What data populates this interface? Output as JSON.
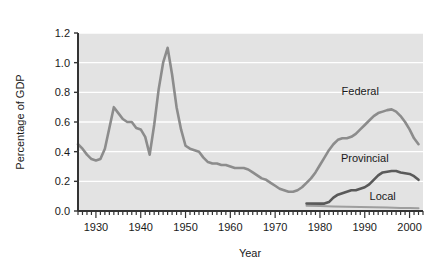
{
  "chart_data": {
    "type": "line",
    "title": "",
    "xlabel": "Year",
    "ylabel": "Percentage of GDP",
    "xlim": [
      1926,
      2003
    ],
    "ylim": [
      0.0,
      1.2
    ],
    "xticks": [
      1930,
      1940,
      1950,
      1960,
      1970,
      1980,
      1990,
      2000
    ],
    "xtick_labels": [
      "1930",
      "1940",
      "1950",
      "1960",
      "1970",
      "1980",
      "1990",
      "2000"
    ],
    "yticks": [
      0.0,
      0.2,
      0.4,
      0.6,
      0.8,
      1.0,
      1.2
    ],
    "ytick_labels": [
      "0.0",
      "0.2",
      "0.4",
      "0.6",
      "0.8",
      "1.0",
      "1.2"
    ],
    "minor_xtick_interval": 1,
    "grid": "horizontal-white-on-gray",
    "plot_background": "#e3e3e3",
    "legend": "inline-annotations",
    "series": [
      {
        "name": "Federal",
        "color": "#8c8c8c",
        "width": 2.6,
        "label_x": 1989,
        "label_y": 0.78,
        "x": [
          1926,
          1927,
          1928,
          1929,
          1930,
          1931,
          1932,
          1933,
          1934,
          1935,
          1936,
          1937,
          1938,
          1939,
          1940,
          1941,
          1942,
          1943,
          1944,
          1945,
          1946,
          1947,
          1948,
          1949,
          1950,
          1951,
          1952,
          1953,
          1954,
          1955,
          1956,
          1957,
          1958,
          1959,
          1960,
          1961,
          1962,
          1963,
          1964,
          1965,
          1966,
          1967,
          1968,
          1969,
          1970,
          1971,
          1972,
          1973,
          1974,
          1975,
          1976,
          1977,
          1978,
          1979,
          1980,
          1981,
          1982,
          1983,
          1984,
          1985,
          1986,
          1987,
          1988,
          1989,
          1990,
          1991,
          1992,
          1993,
          1994,
          1995,
          1996,
          1997,
          1998,
          1999,
          2000,
          2001,
          2002
        ],
        "y": [
          0.45,
          0.42,
          0.38,
          0.35,
          0.34,
          0.35,
          0.42,
          0.56,
          0.7,
          0.66,
          0.62,
          0.6,
          0.6,
          0.56,
          0.55,
          0.5,
          0.38,
          0.58,
          0.82,
          1.0,
          1.1,
          0.92,
          0.7,
          0.55,
          0.44,
          0.42,
          0.41,
          0.4,
          0.36,
          0.33,
          0.32,
          0.32,
          0.31,
          0.31,
          0.3,
          0.29,
          0.29,
          0.29,
          0.28,
          0.26,
          0.24,
          0.22,
          0.21,
          0.19,
          0.17,
          0.15,
          0.14,
          0.13,
          0.13,
          0.14,
          0.16,
          0.19,
          0.22,
          0.26,
          0.31,
          0.36,
          0.41,
          0.45,
          0.48,
          0.49,
          0.49,
          0.5,
          0.52,
          0.55,
          0.58,
          0.61,
          0.64,
          0.66,
          0.67,
          0.68,
          0.685,
          0.67,
          0.64,
          0.6,
          0.55,
          0.49,
          0.45
        ]
      },
      {
        "name": "Provincial",
        "color": "#595959",
        "width": 2.6,
        "label_x": 1990,
        "label_y": 0.33,
        "x": [
          1977,
          1978,
          1979,
          1980,
          1981,
          1982,
          1983,
          1984,
          1985,
          1986,
          1987,
          1988,
          1989,
          1990,
          1991,
          1992,
          1993,
          1994,
          1995,
          1996,
          1997,
          1998,
          1999,
          2000,
          2001,
          2002
        ],
        "y": [
          0.05,
          0.05,
          0.05,
          0.05,
          0.05,
          0.06,
          0.09,
          0.11,
          0.12,
          0.13,
          0.14,
          0.14,
          0.15,
          0.16,
          0.18,
          0.21,
          0.24,
          0.26,
          0.265,
          0.27,
          0.27,
          0.26,
          0.255,
          0.25,
          0.235,
          0.21
        ]
      },
      {
        "name": "Local",
        "color": "#9e9e9e",
        "width": 2.0,
        "label_x": 1994,
        "label_y": 0.075,
        "x": [
          1977,
          1980,
          1983,
          1986,
          1989,
          1992,
          1995,
          1998,
          2000,
          2002
        ],
        "y": [
          0.035,
          0.033,
          0.031,
          0.029,
          0.027,
          0.025,
          0.023,
          0.021,
          0.02,
          0.018
        ]
      }
    ]
  }
}
